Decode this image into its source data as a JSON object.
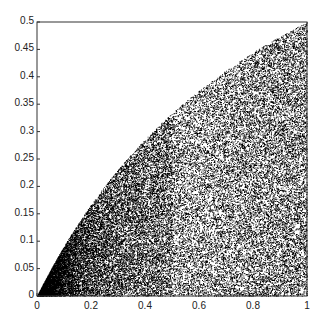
{
  "chart_data": {
    "type": "scatter",
    "title": "",
    "xlabel": "",
    "ylabel": "",
    "xlim": [
      0,
      1
    ],
    "ylim": [
      0,
      0.5
    ],
    "xticks": [
      "0",
      "0.2",
      "0.4",
      "0.6",
      "0.8",
      "1"
    ],
    "yticks": [
      "0",
      "0.05",
      "0.1",
      "0.15",
      "0.2",
      "0.25",
      "0.3",
      "0.35",
      "0.4",
      "0.45",
      "0.5"
    ],
    "grid": false,
    "legend": null,
    "boundary_curve": {
      "x": [
        0,
        0.2,
        0.4,
        0.6,
        0.8,
        1.0
      ],
      "y": [
        0,
        0.167,
        0.286,
        0.375,
        0.444,
        0.5
      ]
    },
    "point_color": "#000000"
  }
}
